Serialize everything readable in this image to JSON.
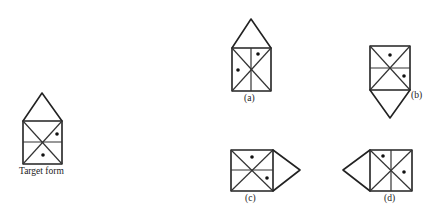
{
  "figure": {
    "type": "spatial-reasoning-puzzle",
    "colors": {
      "stroke": "#222222",
      "background": "#ffffff"
    }
  },
  "shapes": [
    {
      "id": "target",
      "label": "Target form",
      "pointer": "triangle-up",
      "dots": 2
    },
    {
      "id": "a",
      "label": "(a)",
      "pointer": "triangle-up",
      "dots": 2
    },
    {
      "id": "b",
      "label": "(b)",
      "pointer": "triangle-down",
      "dots": 2
    },
    {
      "id": "c",
      "label": "(c)",
      "pointer": "triangle-right",
      "dots": 2
    },
    {
      "id": "d",
      "label": "(d)",
      "pointer": "triangle-left",
      "dots": 2
    }
  ]
}
